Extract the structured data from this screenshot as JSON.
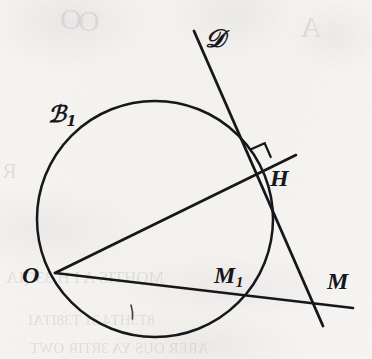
{
  "figure": {
    "kind": "geometry-diagram",
    "width": 372,
    "height": 359,
    "ink_color": "#17161a",
    "paper_color": "#f6f5f2",
    "bleed_color": "#b9b2ba"
  },
  "labels": {
    "circle": {
      "base": "ℬ",
      "sub": "1",
      "name": "circle-label-C1"
    },
    "line_d": {
      "base": "𝒟",
      "name": "line-label-D"
    },
    "point_h": {
      "base": "H",
      "name": "point-label-H"
    },
    "point_o": {
      "base": "O",
      "name": "point-label-O"
    },
    "point_m1": {
      "base": "M",
      "sub": "1",
      "name": "point-label-M1"
    },
    "point_m": {
      "base": "M",
      "name": "point-label-M"
    }
  },
  "geometry": {
    "circle": {
      "cx": 155,
      "cy": 219,
      "r": 118,
      "label": "C1"
    },
    "points": {
      "O": {
        "x": 55,
        "y": 273
      },
      "H": {
        "x": 257,
        "y": 163
      },
      "M1": {
        "x": 243,
        "y": 291
      },
      "M": {
        "x": 317,
        "y": 303
      }
    },
    "segments": [
      {
        "name": "ray-O-to-H",
        "from": "O",
        "to_x": 296,
        "to_y": 155
      },
      {
        "name": "ray-O-to-M",
        "from": "O",
        "to_x": 353,
        "to_y": 308
      }
    ],
    "line_d": {
      "name": "tangent-line-D",
      "x1": 194,
      "y1": 31,
      "x2": 323,
      "y2": 326
    },
    "right_angle": {
      "name": "right-angle-mark-at-H",
      "at": "H",
      "size": 15
    }
  },
  "bleed_through": [
    {
      "text": "O",
      "left": 60,
      "top": 2,
      "size": 30
    },
    {
      "text": "O",
      "left": 78,
      "top": 4,
      "size": 30
    },
    {
      "text": "R",
      "left": 2,
      "top": 158,
      "size": 22
    },
    {
      "text": "A",
      "left": 300,
      "top": 10,
      "size": 30
    },
    {
      "text": "MOHTIS A I H 33QIA",
      "left": 6,
      "top": 268,
      "size": 17
    },
    {
      "text": "8T3HT4 31 T38ITAI",
      "left": 28,
      "top": 312,
      "size": 15
    },
    {
      "text": "ARER OUS YA 3RTIR OWT",
      "left": 30,
      "top": 340,
      "size": 15
    }
  ]
}
